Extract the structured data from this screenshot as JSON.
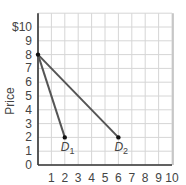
{
  "chart_data": {
    "type": "line",
    "title": "",
    "xlabel": "",
    "ylabel": "Price",
    "xlim": [
      0,
      10
    ],
    "ylim": [
      0,
      11
    ],
    "grid": true,
    "x_ticks": [
      "1",
      "2",
      "3",
      "4",
      "5",
      "6",
      "7",
      "8",
      "9",
      "10"
    ],
    "y_ticks": [
      "0",
      "1",
      "2",
      "3",
      "4",
      "5",
      "6",
      "7",
      "8",
      "9",
      "$10"
    ],
    "series": [
      {
        "name": "D1",
        "label_main": "D",
        "label_sub": "1",
        "points": [
          [
            0,
            8
          ],
          [
            2,
            2
          ]
        ],
        "color": "#555555"
      },
      {
        "name": "D2",
        "label_main": "D",
        "label_sub": "2",
        "points": [
          [
            0,
            8
          ],
          [
            6,
            2
          ]
        ],
        "color": "#555555"
      }
    ],
    "markers": [
      [
        0,
        8
      ],
      [
        2,
        2
      ],
      [
        6,
        2
      ]
    ]
  }
}
